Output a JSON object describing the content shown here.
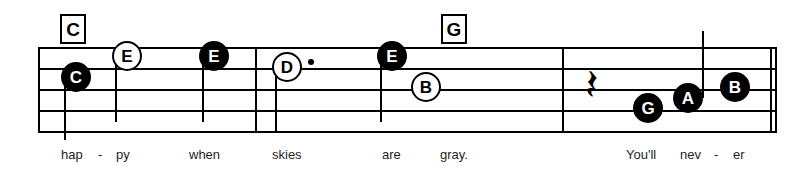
{
  "sheet": {
    "width": 811,
    "height": 172,
    "background_color": "#ffffff",
    "ink_color": "#000000",
    "lyric_color": "#231f20"
  },
  "staff": {
    "line_count": 5,
    "left": 38,
    "right": 777,
    "line_y": [
      47,
      68,
      89,
      110,
      131
    ]
  },
  "barlines": [
    {
      "name": "barline-start",
      "x": 38
    },
    {
      "name": "barline-1",
      "x": 255
    },
    {
      "name": "barline-2",
      "x": 562
    },
    {
      "name": "barline-3",
      "x": 770
    },
    {
      "name": "barline-end",
      "x": 775
    }
  ],
  "chords": [
    {
      "label": "C",
      "x": 60,
      "y": 14
    },
    {
      "label": "G",
      "x": 441,
      "y": 14
    }
  ],
  "notes": [
    {
      "letter": "C",
      "style": "filled",
      "x": 61,
      "y": 62,
      "stem": "down",
      "stem_x": 64,
      "stem_top": 77,
      "stem_bottom": 140,
      "dotted": false
    },
    {
      "letter": "E",
      "style": "hollow",
      "x": 112,
      "y": 41,
      "stem": "down",
      "stem_x": 115,
      "stem_top": 56,
      "stem_bottom": 122,
      "dotted": false
    },
    {
      "letter": "E",
      "style": "filled",
      "x": 199,
      "y": 41,
      "stem": "down",
      "stem_x": 202,
      "stem_top": 56,
      "stem_bottom": 122,
      "dotted": false
    },
    {
      "letter": "D",
      "style": "hollow",
      "x": 272,
      "y": 52,
      "stem": "down",
      "stem_x": 275,
      "stem_top": 67,
      "stem_bottom": 133,
      "dotted": true,
      "dot_x": 308,
      "dot_y": 59
    },
    {
      "letter": "E",
      "style": "filled",
      "x": 377,
      "y": 41,
      "stem": "down",
      "stem_x": 380,
      "stem_top": 56,
      "stem_bottom": 122,
      "dotted": false
    },
    {
      "letter": "B",
      "style": "hollow",
      "x": 411,
      "y": 72,
      "stem": "none",
      "dotted": false
    },
    {
      "letter": "G",
      "style": "filled",
      "x": 633,
      "y": 93,
      "stem": "none",
      "dotted": false
    },
    {
      "letter": "A",
      "style": "filled",
      "x": 673,
      "y": 83,
      "stem": "up",
      "stem_x": 702,
      "stem_top": 31,
      "stem_bottom": 98,
      "dotted": false
    },
    {
      "letter": "B",
      "style": "filled",
      "x": 720,
      "y": 72,
      "stem": "none",
      "dotted": false
    }
  ],
  "rests": [
    {
      "type": "quarter-rest",
      "glyph": "𝄽",
      "x": 585,
      "y": 63
    }
  ],
  "lyrics": [
    {
      "text": "hap",
      "x": 61,
      "y": 148
    },
    {
      "text": "-",
      "x": 98,
      "y": 148
    },
    {
      "text": "py",
      "x": 116,
      "y": 148
    },
    {
      "text": "when",
      "x": 189,
      "y": 148
    },
    {
      "text": "skies",
      "x": 272,
      "y": 148
    },
    {
      "text": "are",
      "x": 382,
      "y": 148
    },
    {
      "text": "gray.",
      "x": 440,
      "y": 148
    },
    {
      "text": "You'll",
      "x": 626,
      "y": 148
    },
    {
      "text": "nev",
      "x": 680,
      "y": 148
    },
    {
      "text": "-",
      "x": 714,
      "y": 148
    },
    {
      "text": "er",
      "x": 733,
      "y": 148
    }
  ]
}
